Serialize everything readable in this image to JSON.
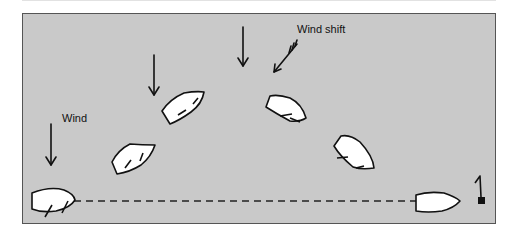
{
  "diagram": {
    "labels": {
      "wind": "Wind",
      "wind_shift": "Wind shift"
    },
    "mark_number": "1",
    "colors": {
      "water": "#c9c9c9",
      "boat_fill": "#ffffff",
      "ink": "#111111"
    }
  }
}
